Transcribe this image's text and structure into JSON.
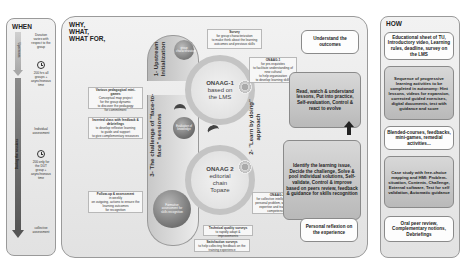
{
  "when": {
    "title": "WHEN",
    "arrow_label_top": "Upstream",
    "arrow_label_mid": "During the sessions",
    "items": [
      {
        "text": "Duration varies with respect to the group"
      },
      {
        "text": "200 hrs all groups + asynchronous time"
      },
      {
        "text": "Individual assessment"
      },
      {
        "text": "200 only for the DUT group + asynchronous time"
      },
      {
        "text": "collective assessment"
      }
    ],
    "icons": [
      "clock-icon",
      "clock-icon"
    ]
  },
  "why": {
    "title_lines": [
      "WHY,",
      "WHAT,",
      "WHAT FOR,"
    ],
    "notes": [
      {
        "title": "Survey",
        "lines": [
          "for group characterization",
          "to make think about the learning",
          "outcomes and previous skills"
        ]
      },
      {
        "title": "ONAAG-1",
        "lines": [
          "for pre-requisites",
          "to facilitate understanding of",
          "new cultural",
          "to help organization",
          "to develop learning skills"
        ]
      },
      {
        "title": "Various pedagogical mini-games",
        "lines": [
          "Conceptual map project",
          "for the group dynamic",
          "to discover the pedagogy",
          "for commitment"
        ]
      },
      {
        "title": "Inverted class with feedback & debriefings",
        "lines": [
          "to develop reflexive learning",
          "to guide and support",
          "to give complementary resources"
        ]
      },
      {
        "title": "Follow-up & assessment",
        "lines": [
          "in weekly",
          "on outgoing, actions to ensure the",
          "learning outcomes",
          "for recognition"
        ]
      },
      {
        "title": "ONAAG-2",
        "lines": [
          "for collective intelligence and",
          "personal problem, with specific",
          "expertise and transversal",
          "competencies"
        ]
      },
      {
        "title": "Technical quality surveys",
        "lines": [
          "to rapidly adapt & improvements"
        ]
      },
      {
        "title": "Satisfaction surveys",
        "lines": [
          "to help collecting feedback on the",
          "training experience"
        ]
      }
    ],
    "side_labels": {
      "upstream": "1- Upstream Initialization",
      "challenge": "3- The challenge of \"face-to-face\" sessions",
      "learn": "2- \"Learn by doing\" approach"
    },
    "circles": {
      "group": "group characterization",
      "onaag1": [
        "ONAAG-1",
        "based on",
        "the LMS"
      ],
      "evaluation": "Evaluation of knowledge",
      "onaag2": [
        "ONAAG 2",
        "editorial",
        "chain",
        "Topaze"
      ],
      "formative": "Formative assessment for skills recognition"
    },
    "boxes": [
      {
        "text": "Understand the outcomes",
        "style": "white"
      },
      {
        "text": "Read, watch & understand lessons, Put into practice, Self-evaluation, Control & react to evolve",
        "style": "grey"
      },
      {
        "text": "Identify the learning issue, Decide the challenge, Solve & pool individual solutions, Self-validate, Control & improve based on peers review, feedback & guidance for skills recognition",
        "style": "grey"
      },
      {
        "text": "Personal reflexion on the experience",
        "style": "white"
      }
    ]
  },
  "how": {
    "title": "HOW",
    "boxes": [
      {
        "text": "Educational sheet of TU, Introductory video, Learning rules, deadline, survey on the LMS",
        "style": "white"
      },
      {
        "text": "Sequence of progressive learning activities to be completed in autonomy: Hint lessons, videos for expansion, corrected guided exercises, digital documents, test with guidance and score",
        "style": "grey"
      },
      {
        "text": "Blended-courses, feedbacks, mini-games, remedial activities...",
        "style": "white"
      },
      {
        "text": "Case study with free-choice mapping and HMI: Problem-situation, Contents, Challenge, External software, Test for self validation, Automatic guidance",
        "style": "grey"
      },
      {
        "text": "Oral peer review, Complementary notions, Debriefings",
        "style": "white"
      }
    ]
  },
  "colors": {
    "panel_bg": "#e9e9e9",
    "panel_border": "#9a9a9a",
    "arrow_grey": "#9c9c9c",
    "arrow_dark": "#555555",
    "ring": "#bdbdbd",
    "sphere_dark": "#7a7a7a"
  }
}
